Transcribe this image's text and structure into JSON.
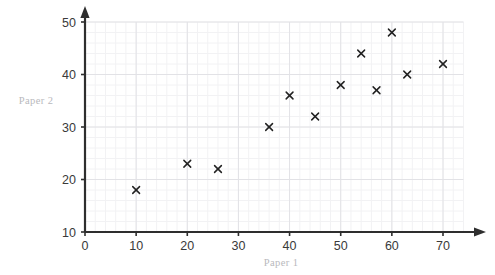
{
  "chart_data": {
    "type": "scatter",
    "title": "",
    "xlabel": "Paper 1",
    "ylabel": "Paper 2",
    "xlim": [
      0,
      74
    ],
    "ylim": [
      10,
      50
    ],
    "xticks": [
      0,
      10,
      20,
      30,
      40,
      50,
      60,
      70
    ],
    "yticks": [
      10,
      20,
      30,
      40,
      50
    ],
    "xtick_labels": [
      "0",
      "10",
      "20",
      "30",
      "40",
      "50",
      "60",
      "70"
    ],
    "ytick_labels": [
      "10",
      "20",
      "30",
      "40",
      "50"
    ],
    "grid": true,
    "grid_minor_step_x": 2,
    "grid_minor_step_y": 2,
    "legend": "none",
    "marker": "x",
    "marker_color": "#222222",
    "grid_color": "#e2e2e6",
    "axis_color": "#2e2e2e",
    "label_color": "#b9b9bd",
    "points": [
      {
        "x": 10,
        "y": 18
      },
      {
        "x": 20,
        "y": 23
      },
      {
        "x": 26,
        "y": 22
      },
      {
        "x": 36,
        "y": 30
      },
      {
        "x": 40,
        "y": 36
      },
      {
        "x": 45,
        "y": 32
      },
      {
        "x": 50,
        "y": 38
      },
      {
        "x": 54,
        "y": 44
      },
      {
        "x": 57,
        "y": 37
      },
      {
        "x": 60,
        "y": 48
      },
      {
        "x": 63,
        "y": 40
      },
      {
        "x": 70,
        "y": 42
      }
    ]
  }
}
